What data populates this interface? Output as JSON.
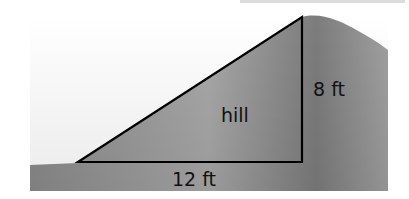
{
  "diagram": {
    "labels": {
      "height": "8 ft",
      "base": "12 ft",
      "region": "hill"
    },
    "colors": {
      "hill_fill": "#9a9a9a",
      "hill_dark": "#7e7e7e",
      "hill_light": "#b4b4b4",
      "outline": "#000000",
      "background": "#ffffff"
    },
    "triangle": {
      "base_ft": 12,
      "height_ft": 8
    }
  }
}
